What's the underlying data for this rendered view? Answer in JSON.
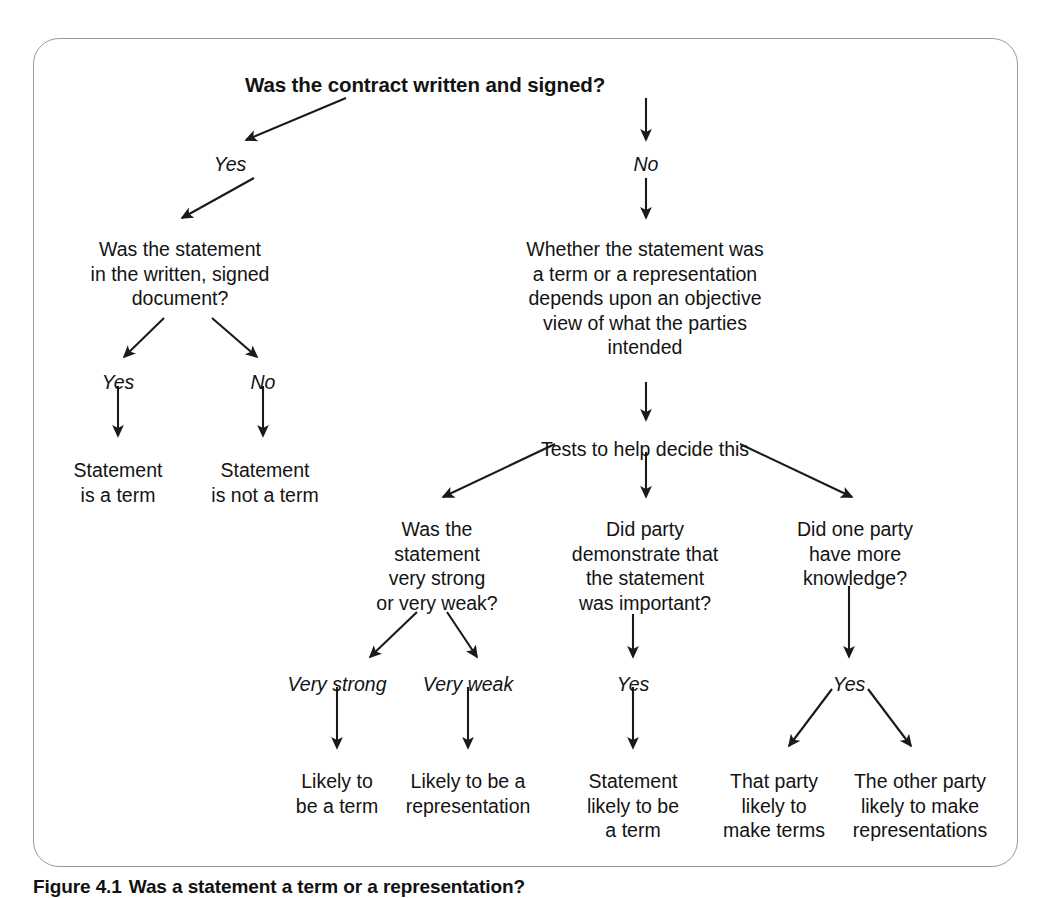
{
  "figure": {
    "caption_label": "Figure 4.1",
    "caption_text": "Was a statement a term or a representation?"
  },
  "diagram_data": {
    "type": "flowchart",
    "title": "Was the contract written and signed?",
    "nodes": [
      {
        "id": "root",
        "text": "Was the contract written and signed?",
        "x": 425,
        "y": 72,
        "bold": true
      },
      {
        "id": "left_q",
        "text": "Was the statement\nin the written, signed\ndocument?",
        "x": 180,
        "y": 237
      },
      {
        "id": "left_yes_out",
        "text": "Statement\nis a term",
        "x": 118,
        "y": 458
      },
      {
        "id": "left_no_out",
        "text": "Statement\nis not a term",
        "x": 265,
        "y": 458
      },
      {
        "id": "right_q",
        "text": "Whether the statement was\na term or a representation\ndepends upon an objective\nview of what the parties\nintended",
        "x": 645,
        "y": 237
      },
      {
        "id": "tests",
        "text": "Tests to help decide this",
        "x": 645,
        "y": 437
      },
      {
        "id": "test_strength",
        "text": "Was the\nstatement\nvery strong\nor very weak?",
        "x": 437,
        "y": 517
      },
      {
        "id": "test_importance",
        "text": "Did party\ndemonstrate that\nthe statement\nwas important?",
        "x": 645,
        "y": 517
      },
      {
        "id": "test_knowledge",
        "text": "Did one party\nhave more\nknowledge?",
        "x": 855,
        "y": 517
      },
      {
        "id": "out_term",
        "text": "Likely to\nbe a term",
        "x": 337,
        "y": 769
      },
      {
        "id": "out_rep",
        "text": "Likely to be a\nrepresentation",
        "x": 468,
        "y": 769
      },
      {
        "id": "out_stmt_term",
        "text": "Statement\nlikely to be\na term",
        "x": 633,
        "y": 769
      },
      {
        "id": "out_that_party",
        "text": "That party\nlikely to\nmake terms",
        "x": 774,
        "y": 769
      },
      {
        "id": "out_other_party",
        "text": "The other party\nlikely to make\nrepresentations",
        "x": 920,
        "y": 769
      }
    ],
    "edge_labels": [
      {
        "id": "lbl_yes_top",
        "text": "Yes",
        "x": 230,
        "y": 153
      },
      {
        "id": "lbl_no_top",
        "text": "No",
        "x": 646,
        "y": 153
      },
      {
        "id": "lbl_yes_left",
        "text": "Yes",
        "x": 118,
        "y": 371
      },
      {
        "id": "lbl_no_left",
        "text": "No",
        "x": 263,
        "y": 371
      },
      {
        "id": "lbl_very_strong",
        "text": "Very strong",
        "x": 337,
        "y": 673
      },
      {
        "id": "lbl_very_weak",
        "text": "Very weak",
        "x": 468,
        "y": 673
      },
      {
        "id": "lbl_yes_mid",
        "text": "Yes",
        "x": 633,
        "y": 673
      },
      {
        "id": "lbl_yes_right",
        "text": "Yes",
        "x": 849,
        "y": 673
      }
    ],
    "edges": [
      {
        "from": "root",
        "to": "lbl_yes_top",
        "x1": 346,
        "y1": 98,
        "x2": 246,
        "y2": 140
      },
      {
        "from": "root",
        "to": "lbl_no_top",
        "x1": 646,
        "y1": 98,
        "x2": 646,
        "y2": 140
      },
      {
        "from": "lbl_yes_top",
        "to": "left_q",
        "x1": 254,
        "y1": 178,
        "x2": 182,
        "y2": 218
      },
      {
        "from": "lbl_no_top",
        "to": "right_q",
        "x1": 646,
        "y1": 178,
        "x2": 646,
        "y2": 218
      },
      {
        "from": "left_q",
        "to": "lbl_yes_left",
        "x1": 164,
        "y1": 318,
        "x2": 124,
        "y2": 357
      },
      {
        "from": "left_q",
        "to": "lbl_no_left",
        "x1": 212,
        "y1": 318,
        "x2": 257,
        "y2": 357
      },
      {
        "from": "lbl_yes_left",
        "to": "left_yes_out",
        "x1": 118,
        "y1": 386,
        "x2": 118,
        "y2": 436
      },
      {
        "from": "lbl_no_left",
        "to": "left_no_out",
        "x1": 263,
        "y1": 386,
        "x2": 263,
        "y2": 436
      },
      {
        "from": "right_q",
        "to": "tests",
        "x1": 646,
        "y1": 382,
        "x2": 646,
        "y2": 420
      },
      {
        "from": "tests",
        "to": "test_strength",
        "x1": 555,
        "y1": 444,
        "x2": 443,
        "y2": 497
      },
      {
        "from": "tests",
        "to": "test_importance",
        "x1": 646,
        "y1": 452,
        "x2": 646,
        "y2": 497
      },
      {
        "from": "tests",
        "to": "test_knowledge",
        "x1": 740,
        "y1": 444,
        "x2": 852,
        "y2": 497
      },
      {
        "from": "test_strength",
        "to": "lbl_very_strong",
        "x1": 417,
        "y1": 612,
        "x2": 370,
        "y2": 657
      },
      {
        "from": "test_strength",
        "to": "lbl_very_weak",
        "x1": 447,
        "y1": 612,
        "x2": 477,
        "y2": 657
      },
      {
        "from": "test_importance",
        "to": "lbl_yes_mid",
        "x1": 633,
        "y1": 614,
        "x2": 633,
        "y2": 657
      },
      {
        "from": "test_knowledge",
        "to": "lbl_yes_right",
        "x1": 849,
        "y1": 586,
        "x2": 849,
        "y2": 657
      },
      {
        "from": "lbl_very_strong",
        "to": "out_term",
        "x1": 337,
        "y1": 687,
        "x2": 337,
        "y2": 748
      },
      {
        "from": "lbl_very_weak",
        "to": "out_rep",
        "x1": 468,
        "y1": 687,
        "x2": 468,
        "y2": 748
      },
      {
        "from": "lbl_yes_mid",
        "to": "out_stmt_term",
        "x1": 633,
        "y1": 687,
        "x2": 633,
        "y2": 748
      },
      {
        "from": "lbl_yes_right",
        "to": "out_that_party",
        "x1": 832,
        "y1": 689,
        "x2": 789,
        "y2": 746
      },
      {
        "from": "lbl_yes_right",
        "to": "out_other_party",
        "x1": 868,
        "y1": 689,
        "x2": 911,
        "y2": 746
      }
    ]
  }
}
